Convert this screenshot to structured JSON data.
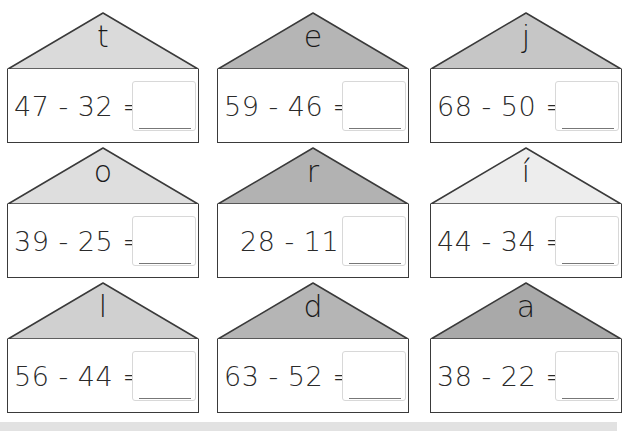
{
  "worksheet": {
    "houses": [
      {
        "letter": "t",
        "expression": "47 - 32 =",
        "answer": "",
        "roof_color": "#dadada"
      },
      {
        "letter": "e",
        "expression": "59 - 46 =",
        "answer": "",
        "roof_color": "#b5b5b5"
      },
      {
        "letter": "j",
        "expression": "68 - 50 =",
        "answer": "",
        "roof_color": "#c6c6c6"
      },
      {
        "letter": "o",
        "expression": "39 - 25 =",
        "answer": "",
        "roof_color": "#dedede"
      },
      {
        "letter": "r",
        "expression": "28 - 11 =",
        "answer": "",
        "roof_color": "#b2b2b2"
      },
      {
        "letter": "í",
        "expression": "44 - 34 =",
        "answer": "",
        "roof_color": "#ededed"
      },
      {
        "letter": "l",
        "expression": "56 - 44 =",
        "answer": "",
        "roof_color": "#d0d0d0"
      },
      {
        "letter": "d",
        "expression": "63 - 52 =",
        "answer": "",
        "roof_color": "#b5b5b5"
      },
      {
        "letter": "a",
        "expression": "38 - 22 =",
        "answer": "",
        "roof_color": "#a9a9a9"
      }
    ]
  }
}
